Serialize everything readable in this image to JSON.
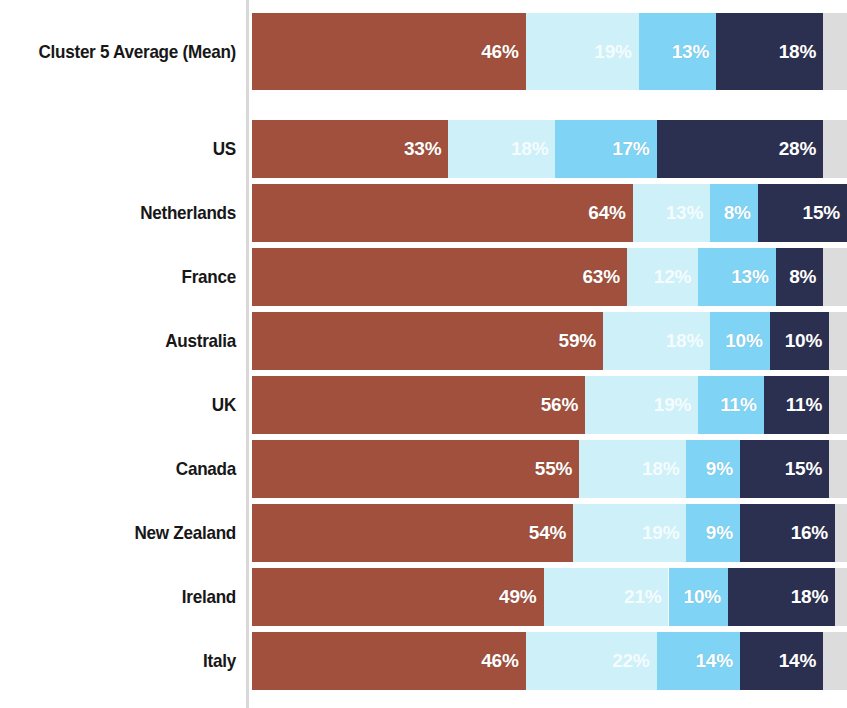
{
  "chart_data": {
    "type": "bar",
    "subtype": "horizontal-stacked-100",
    "title": "",
    "subtitle": "",
    "xlabel": "",
    "ylabel": "",
    "xlim": [
      0,
      100
    ],
    "grid": false,
    "legend_position": "none",
    "unit": "%",
    "categories": [
      "Cluster 5 Average (Mean)",
      "US",
      "Netherlands",
      "France",
      "Australia",
      "UK",
      "Canada",
      "New Zealand",
      "Ireland",
      "Italy"
    ],
    "series": [
      {
        "name": "segment-1",
        "color": "#A0503C",
        "values": [
          46,
          33,
          64,
          63,
          59,
          56,
          55,
          54,
          49,
          46
        ]
      },
      {
        "name": "segment-2",
        "color": "#CDF0F9",
        "values": [
          19,
          18,
          13,
          12,
          18,
          19,
          18,
          19,
          21,
          22
        ]
      },
      {
        "name": "segment-3",
        "color": "#7FD4F5",
        "values": [
          13,
          17,
          8,
          13,
          10,
          11,
          9,
          9,
          10,
          14
        ]
      },
      {
        "name": "segment-4",
        "color": "#2C3050",
        "values": [
          18,
          28,
          15,
          8,
          10,
          11,
          15,
          16,
          18,
          14
        ]
      },
      {
        "name": "segment-5",
        "color": "#DCDCDC",
        "values": [
          4,
          4,
          0,
          4,
          3,
          3,
          3,
          2,
          2,
          4
        ],
        "labelled": false
      }
    ],
    "value_labels": [
      [
        "46%",
        "19%",
        "13%",
        "18%"
      ],
      [
        "33%",
        "18%",
        "17%",
        "28%"
      ],
      [
        "64%",
        "13%",
        "8%",
        "15%"
      ],
      [
        "63%",
        "12%",
        "13%",
        "8%"
      ],
      [
        "59%",
        "18%",
        "10%",
        "10%"
      ],
      [
        "56%",
        "19%",
        "11%",
        "11%"
      ],
      [
        "55%",
        "18%",
        "9%",
        "15%"
      ],
      [
        "54%",
        "19%",
        "9%",
        "16%"
      ],
      [
        "49%",
        "21%",
        "10%",
        "18%"
      ],
      [
        "46%",
        "22%",
        "14%",
        "14%"
      ]
    ]
  },
  "rows": [
    {
      "label": "Cluster 5 Average (Mean)",
      "emphasis": true,
      "segments": [
        {
          "name": "segment-1",
          "value": 46,
          "label": "46%",
          "color": "#A0503C",
          "pale": false,
          "labelled": true
        },
        {
          "name": "segment-2",
          "value": 19,
          "label": "19%",
          "color": "#CDF0F9",
          "pale": true,
          "labelled": true
        },
        {
          "name": "segment-3",
          "value": 13,
          "label": "13%",
          "color": "#7FD4F5",
          "pale": false,
          "labelled": true
        },
        {
          "name": "segment-4",
          "value": 18,
          "label": "18%",
          "color": "#2C3050",
          "pale": false,
          "labelled": true
        },
        {
          "name": "segment-5",
          "value": 4,
          "label": "",
          "color": "#DCDCDC",
          "pale": false,
          "labelled": false
        }
      ]
    },
    {
      "label": "US",
      "emphasis": false,
      "segments": [
        {
          "name": "segment-1",
          "value": 33,
          "label": "33%",
          "color": "#A0503C",
          "pale": false,
          "labelled": true
        },
        {
          "name": "segment-2",
          "value": 18,
          "label": "18%",
          "color": "#CDF0F9",
          "pale": true,
          "labelled": true
        },
        {
          "name": "segment-3",
          "value": 17,
          "label": "17%",
          "color": "#7FD4F5",
          "pale": false,
          "labelled": true
        },
        {
          "name": "segment-4",
          "value": 28,
          "label": "28%",
          "color": "#2C3050",
          "pale": false,
          "labelled": true
        },
        {
          "name": "segment-5",
          "value": 4,
          "label": "",
          "color": "#DCDCDC",
          "pale": false,
          "labelled": false
        }
      ]
    },
    {
      "label": "Netherlands",
      "emphasis": false,
      "segments": [
        {
          "name": "segment-1",
          "value": 64,
          "label": "64%",
          "color": "#A0503C",
          "pale": false,
          "labelled": true
        },
        {
          "name": "segment-2",
          "value": 13,
          "label": "13%",
          "color": "#CDF0F9",
          "pale": true,
          "labelled": true
        },
        {
          "name": "segment-3",
          "value": 8,
          "label": "8%",
          "color": "#7FD4F5",
          "pale": false,
          "labelled": true
        },
        {
          "name": "segment-4",
          "value": 15,
          "label": "15%",
          "color": "#2C3050",
          "pale": false,
          "labelled": true
        },
        {
          "name": "segment-5",
          "value": 0,
          "label": "",
          "color": "#DCDCDC",
          "pale": false,
          "labelled": false
        }
      ]
    },
    {
      "label": "France",
      "emphasis": false,
      "segments": [
        {
          "name": "segment-1",
          "value": 63,
          "label": "63%",
          "color": "#A0503C",
          "pale": false,
          "labelled": true
        },
        {
          "name": "segment-2",
          "value": 12,
          "label": "12%",
          "color": "#CDF0F9",
          "pale": true,
          "labelled": true
        },
        {
          "name": "segment-3",
          "value": 13,
          "label": "13%",
          "color": "#7FD4F5",
          "pale": false,
          "labelled": true
        },
        {
          "name": "segment-4",
          "value": 8,
          "label": "8%",
          "color": "#2C3050",
          "pale": false,
          "labelled": true
        },
        {
          "name": "segment-5",
          "value": 4,
          "label": "",
          "color": "#DCDCDC",
          "pale": false,
          "labelled": false
        }
      ]
    },
    {
      "label": "Australia",
      "emphasis": false,
      "segments": [
        {
          "name": "segment-1",
          "value": 59,
          "label": "59%",
          "color": "#A0503C",
          "pale": false,
          "labelled": true
        },
        {
          "name": "segment-2",
          "value": 18,
          "label": "18%",
          "color": "#CDF0F9",
          "pale": true,
          "labelled": true
        },
        {
          "name": "segment-3",
          "value": 10,
          "label": "10%",
          "color": "#7FD4F5",
          "pale": false,
          "labelled": true
        },
        {
          "name": "segment-4",
          "value": 10,
          "label": "10%",
          "color": "#2C3050",
          "pale": false,
          "labelled": true
        },
        {
          "name": "segment-5",
          "value": 3,
          "label": "",
          "color": "#DCDCDC",
          "pale": false,
          "labelled": false
        }
      ]
    },
    {
      "label": "UK",
      "emphasis": false,
      "segments": [
        {
          "name": "segment-1",
          "value": 56,
          "label": "56%",
          "color": "#A0503C",
          "pale": false,
          "labelled": true
        },
        {
          "name": "segment-2",
          "value": 19,
          "label": "19%",
          "color": "#CDF0F9",
          "pale": true,
          "labelled": true
        },
        {
          "name": "segment-3",
          "value": 11,
          "label": "11%",
          "color": "#7FD4F5",
          "pale": false,
          "labelled": true
        },
        {
          "name": "segment-4",
          "value": 11,
          "label": "11%",
          "color": "#2C3050",
          "pale": false,
          "labelled": true
        },
        {
          "name": "segment-5",
          "value": 3,
          "label": "",
          "color": "#DCDCDC",
          "pale": false,
          "labelled": false
        }
      ]
    },
    {
      "label": "Canada",
      "emphasis": false,
      "segments": [
        {
          "name": "segment-1",
          "value": 55,
          "label": "55%",
          "color": "#A0503C",
          "pale": false,
          "labelled": true
        },
        {
          "name": "segment-2",
          "value": 18,
          "label": "18%",
          "color": "#CDF0F9",
          "pale": true,
          "labelled": true
        },
        {
          "name": "segment-3",
          "value": 9,
          "label": "9%",
          "color": "#7FD4F5",
          "pale": false,
          "labelled": true
        },
        {
          "name": "segment-4",
          "value": 15,
          "label": "15%",
          "color": "#2C3050",
          "pale": false,
          "labelled": true
        },
        {
          "name": "segment-5",
          "value": 3,
          "label": "",
          "color": "#DCDCDC",
          "pale": false,
          "labelled": false
        }
      ]
    },
    {
      "label": "New Zealand",
      "emphasis": false,
      "segments": [
        {
          "name": "segment-1",
          "value": 54,
          "label": "54%",
          "color": "#A0503C",
          "pale": false,
          "labelled": true
        },
        {
          "name": "segment-2",
          "value": 19,
          "label": "19%",
          "color": "#CDF0F9",
          "pale": true,
          "labelled": true
        },
        {
          "name": "segment-3",
          "value": 9,
          "label": "9%",
          "color": "#7FD4F5",
          "pale": false,
          "labelled": true
        },
        {
          "name": "segment-4",
          "value": 16,
          "label": "16%",
          "color": "#2C3050",
          "pale": false,
          "labelled": true
        },
        {
          "name": "segment-5",
          "value": 2,
          "label": "",
          "color": "#DCDCDC",
          "pale": false,
          "labelled": false
        }
      ]
    },
    {
      "label": "Ireland",
      "emphasis": false,
      "segments": [
        {
          "name": "segment-1",
          "value": 49,
          "label": "49%",
          "color": "#A0503C",
          "pale": false,
          "labelled": true
        },
        {
          "name": "segment-2",
          "value": 21,
          "label": "21%",
          "color": "#CDF0F9",
          "pale": true,
          "labelled": true
        },
        {
          "name": "segment-3",
          "value": 10,
          "label": "10%",
          "color": "#7FD4F5",
          "pale": false,
          "labelled": true
        },
        {
          "name": "segment-4",
          "value": 18,
          "label": "18%",
          "color": "#2C3050",
          "pale": false,
          "labelled": true
        },
        {
          "name": "segment-5",
          "value": 2,
          "label": "",
          "color": "#DCDCDC",
          "pale": false,
          "labelled": false
        }
      ]
    },
    {
      "label": "Italy",
      "emphasis": false,
      "segments": [
        {
          "name": "segment-1",
          "value": 46,
          "label": "46%",
          "color": "#A0503C",
          "pale": false,
          "labelled": true
        },
        {
          "name": "segment-2",
          "value": 22,
          "label": "22%",
          "color": "#CDF0F9",
          "pale": true,
          "labelled": true
        },
        {
          "name": "segment-3",
          "value": 14,
          "label": "14%",
          "color": "#7FD4F5",
          "pale": false,
          "labelled": true
        },
        {
          "name": "segment-4",
          "value": 14,
          "label": "14%",
          "color": "#2C3050",
          "pale": false,
          "labelled": true
        },
        {
          "name": "segment-5",
          "value": 4,
          "label": "",
          "color": "#DCDCDC",
          "pale": false,
          "labelled": false
        }
      ]
    }
  ],
  "layout": {
    "track_left": 252,
    "track_width": 595,
    "scale_max": 100,
    "axis_left": 246,
    "first_row_top": 13,
    "first_row_height": 77,
    "row_top": 120,
    "row_height": 58,
    "row_gap": 6
  },
  "colors": {
    "segment_1": "#A0503C",
    "segment_2": "#CDF0F9",
    "segment_3": "#7FD4F5",
    "segment_4": "#2C3050",
    "segment_5": "#DCDCDC",
    "background": "#FFFFFF",
    "axis": "#D8D8D8",
    "label_text": "#171717",
    "value_text": "#FFFFFF"
  }
}
